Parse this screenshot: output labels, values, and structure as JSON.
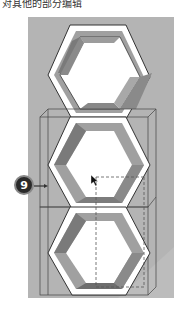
{
  "caption": "对其他的部分编辑",
  "callout": {
    "number": "9"
  },
  "viewport": {
    "background": "#b4b4b4",
    "shapes": [
      "hexagon-top",
      "hexagon-middle",
      "hexagon-bottom"
    ],
    "selection": "bounding-box-wireframe"
  }
}
